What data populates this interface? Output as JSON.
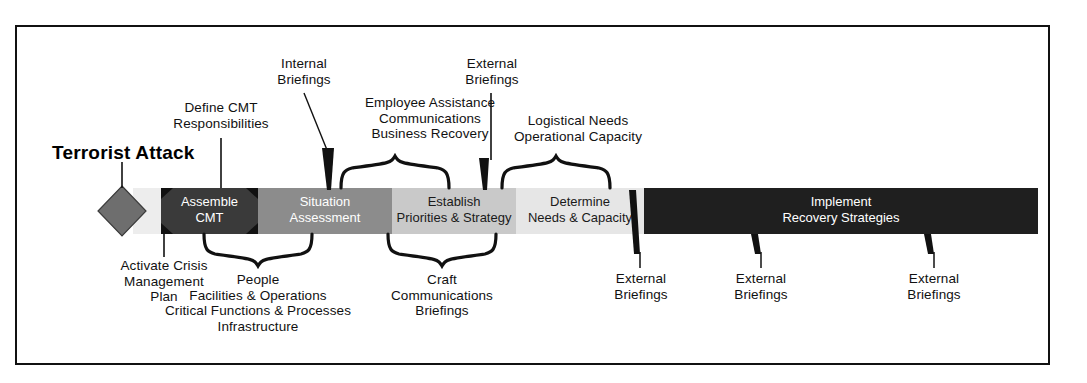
{
  "diagram": {
    "title_label": "Terrorist Attack",
    "frame": {
      "border_color": "#111111"
    },
    "trigger": {
      "shape": "diamond",
      "name": "terrorist-attack-diamond",
      "color": "#6e6e6e"
    },
    "phases": [
      {
        "id": "assemble-cmt",
        "line1": "Assemble",
        "line2": "CMT",
        "fill": "#3a3a3a",
        "text_color": "#ffffff"
      },
      {
        "id": "situation-assessment",
        "line1": "Situation",
        "line2": "Assessment",
        "fill": "#8c8c8c",
        "text_color": "#ffffff"
      },
      {
        "id": "establish-priorities",
        "line1": "Establish",
        "line2": "Priorities & Strategy",
        "fill": "#c9c9c9",
        "text_color": "#1a1a1a"
      },
      {
        "id": "determine-needs",
        "line1": "Determine",
        "line2": "Needs & Capacity",
        "fill": "#e6e6e6",
        "text_color": "#1a1a1a"
      },
      {
        "id": "implement-recovery",
        "line1": "Implement",
        "line2": "Recovery Strategies",
        "fill": "#1f1f1f",
        "text_color": "#ffffff"
      }
    ],
    "annotations_above": [
      {
        "id": "define-cmt",
        "lines": "Define CMT\nResponsibilities",
        "connector": "line"
      },
      {
        "id": "internal-briefings",
        "lines": "Internal\nBriefings",
        "connector": "wedge"
      },
      {
        "id": "employee-assistance",
        "lines": "Employee Assistance\nCommunications\nBusiness Recovery",
        "connector": "brace"
      },
      {
        "id": "external-briefings-top",
        "lines": "External\nBriefings",
        "connector": "wedge"
      },
      {
        "id": "logistical-needs",
        "lines": "Logistical Needs\nOperational Capacity",
        "connector": "brace"
      }
    ],
    "annotations_below": [
      {
        "id": "activate-crisis-plan",
        "lines": "Activate Crisis\nManagement\nPlan",
        "connector": "line"
      },
      {
        "id": "people-facilities",
        "lines": "People\nFacilities & Operations\nCritical Functions & Processes\nInfrastructure",
        "connector": "brace"
      },
      {
        "id": "craft-communications",
        "lines": "Craft\nCommunications\nBriefings",
        "connector": "brace"
      },
      {
        "id": "external-briefings-1",
        "lines": "External\nBriefings",
        "connector": "wedge"
      },
      {
        "id": "external-briefings-2",
        "lines": "External\nBriefings",
        "connector": "wedge"
      },
      {
        "id": "external-briefings-3",
        "lines": "External\nBriefings",
        "connector": "wedge"
      }
    ]
  }
}
